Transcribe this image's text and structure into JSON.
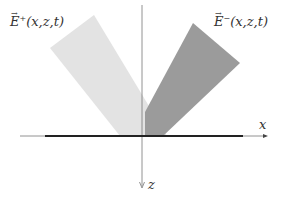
{
  "diagram": {
    "labels": {
      "e_plus": {
        "symbol": "E",
        "superscript": "+",
        "args": "(x,z,t)"
      },
      "e_minus": {
        "symbol": "E",
        "superscript": "−",
        "args": "(x,z,t)"
      },
      "x_axis": "x",
      "z_axis": "z"
    },
    "colors": {
      "background": "#ffffff",
      "e_plus_fill": "#e3e3e3",
      "e_minus_fill": "#9b9b9b",
      "axis_line": "#666666",
      "interface_bar": "#222222"
    },
    "shapes": {
      "e_plus_beam": [
        [
          50,
          48
        ],
        [
          94,
          15
        ],
        [
          167,
          136
        ],
        [
          120,
          136
        ]
      ],
      "e_minus_beam": [
        [
          193,
          23
        ],
        [
          240,
          63
        ],
        [
          163,
          136
        ],
        [
          145,
          136
        ],
        [
          145,
          110
        ]
      ],
      "x_axis": {
        "x1": 20,
        "y1": 136,
        "x2": 268,
        "y2": 136
      },
      "interface": {
        "x1": 45,
        "x2": 243,
        "y": 136
      },
      "z_axis": {
        "x1": 142,
        "y1": 5,
        "x2": 142,
        "y2": 188
      }
    }
  }
}
